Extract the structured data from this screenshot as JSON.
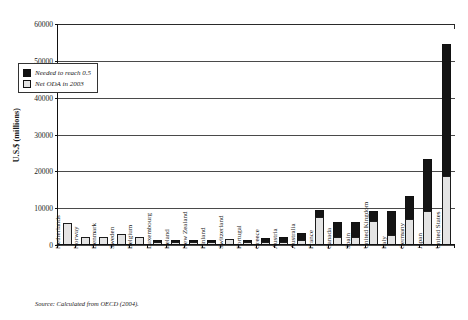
{
  "chart_data": {
    "type": "bar",
    "title": "",
    "subtitle": "",
    "xlabel": "",
    "ylabel": "U.S.$ (millions)",
    "ylim": [
      0,
      60000
    ],
    "yticks": [
      0,
      10000,
      20000,
      30000,
      40000,
      50000,
      60000
    ],
    "grid": true,
    "stacked": true,
    "legend_position": "upper-left-inside",
    "source_note": "Source: Calculated from OECD (2004).",
    "categories": [
      "Netherlands",
      "Norway",
      "Denmark",
      "Sweden",
      "Belgium",
      "Luxembourg",
      "Ireland",
      "New Zealand",
      "Finland",
      "Switzerland",
      "Portugal",
      "Greece",
      "Austria",
      "Australia",
      "France",
      "Canada",
      "Spain",
      "United Kingdom",
      "Italy",
      "Germany",
      "Japan",
      "United States"
    ],
    "series": [
      {
        "name": "Net ODA in 2003",
        "color": "#e4e4e4",
        "values": [
          5800,
          2000,
          2000,
          2800,
          2000,
          200,
          500,
          200,
          600,
          1300,
          350,
          400,
          600,
          1200,
          7200,
          2000,
          2000,
          6300,
          2400,
          6800,
          8900,
          18600
        ]
      },
      {
        "name": "Needed to reach 0.5",
        "color": "#141414",
        "values": [
          0,
          0,
          0,
          0,
          0,
          150,
          550,
          300,
          350,
          0,
          250,
          1000,
          1400,
          1900,
          2100,
          4100,
          4000,
          2700,
          6500,
          6200,
          14100,
          35600
        ]
      }
    ],
    "totals": [
      5800,
      2000,
      2000,
      2800,
      2000,
      350,
      1050,
      500,
      950,
      1300,
      600,
      1400,
      2000,
      3100,
      9300,
      6100,
      6000,
      9000,
      8900,
      13000,
      23000,
      54200
    ]
  },
  "legend": {
    "items": [
      {
        "label": "Needed to reach 0.5",
        "swatch": "dark"
      },
      {
        "label": "Net ODA in 2003",
        "swatch": "light"
      }
    ]
  },
  "axis": {
    "y_title": "U.S.$ (millions)",
    "y_tick_labels": [
      "60000",
      "50000",
      "40000",
      "30000",
      "20000",
      "10000",
      "0"
    ]
  },
  "footer": {
    "source": "Source: Calculated from OECD (2004)."
  }
}
